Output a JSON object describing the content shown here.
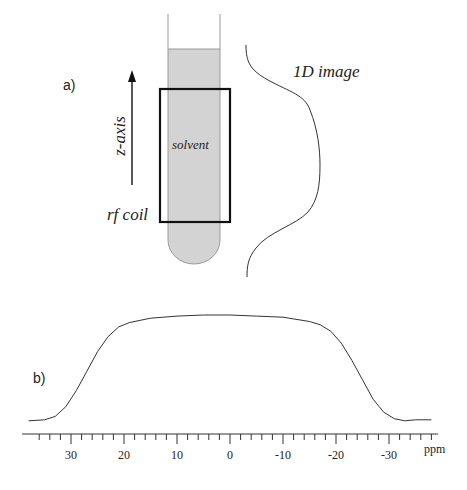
{
  "panel_a": {
    "label": "a)",
    "axis_label": "z-axis",
    "sample_label": "solvent",
    "coil_label": "rf coil",
    "profile_label": "1D image",
    "colors": {
      "solvent_fill": "#d3d3d3",
      "tube_stroke": "#999999",
      "coil_stroke": "#111111",
      "line": "#222222"
    }
  },
  "panel_b": {
    "label": "b)"
  },
  "chart_data": {
    "type": "line",
    "title": "",
    "xlabel": "ppm",
    "ylabel": "",
    "x_reversed": true,
    "xlim": [
      38,
      -39
    ],
    "tick_labels": [
      "30",
      "20",
      "10",
      "0",
      "-10",
      "-20",
      "-30"
    ],
    "tick_values": [
      30,
      20,
      10,
      0,
      -10,
      -20,
      -30
    ],
    "minor_tick_step": 2,
    "grid": false,
    "series": [
      {
        "name": "spectrum",
        "x": [
          38,
          35,
          33,
          31,
          29,
          27,
          25,
          23,
          21,
          19,
          17,
          15,
          10,
          5,
          0,
          -5,
          -10,
          -15,
          -17,
          -19,
          -21,
          -23,
          -25,
          -27,
          -29,
          -31,
          -33,
          -35,
          -38
        ],
        "y": [
          0.02,
          0.03,
          0.06,
          0.15,
          0.3,
          0.48,
          0.66,
          0.8,
          0.89,
          0.93,
          0.95,
          0.97,
          0.99,
          1.0,
          1.0,
          0.99,
          0.98,
          0.94,
          0.91,
          0.85,
          0.74,
          0.58,
          0.4,
          0.22,
          0.1,
          0.04,
          0.02,
          0.03,
          0.03
        ]
      }
    ]
  }
}
